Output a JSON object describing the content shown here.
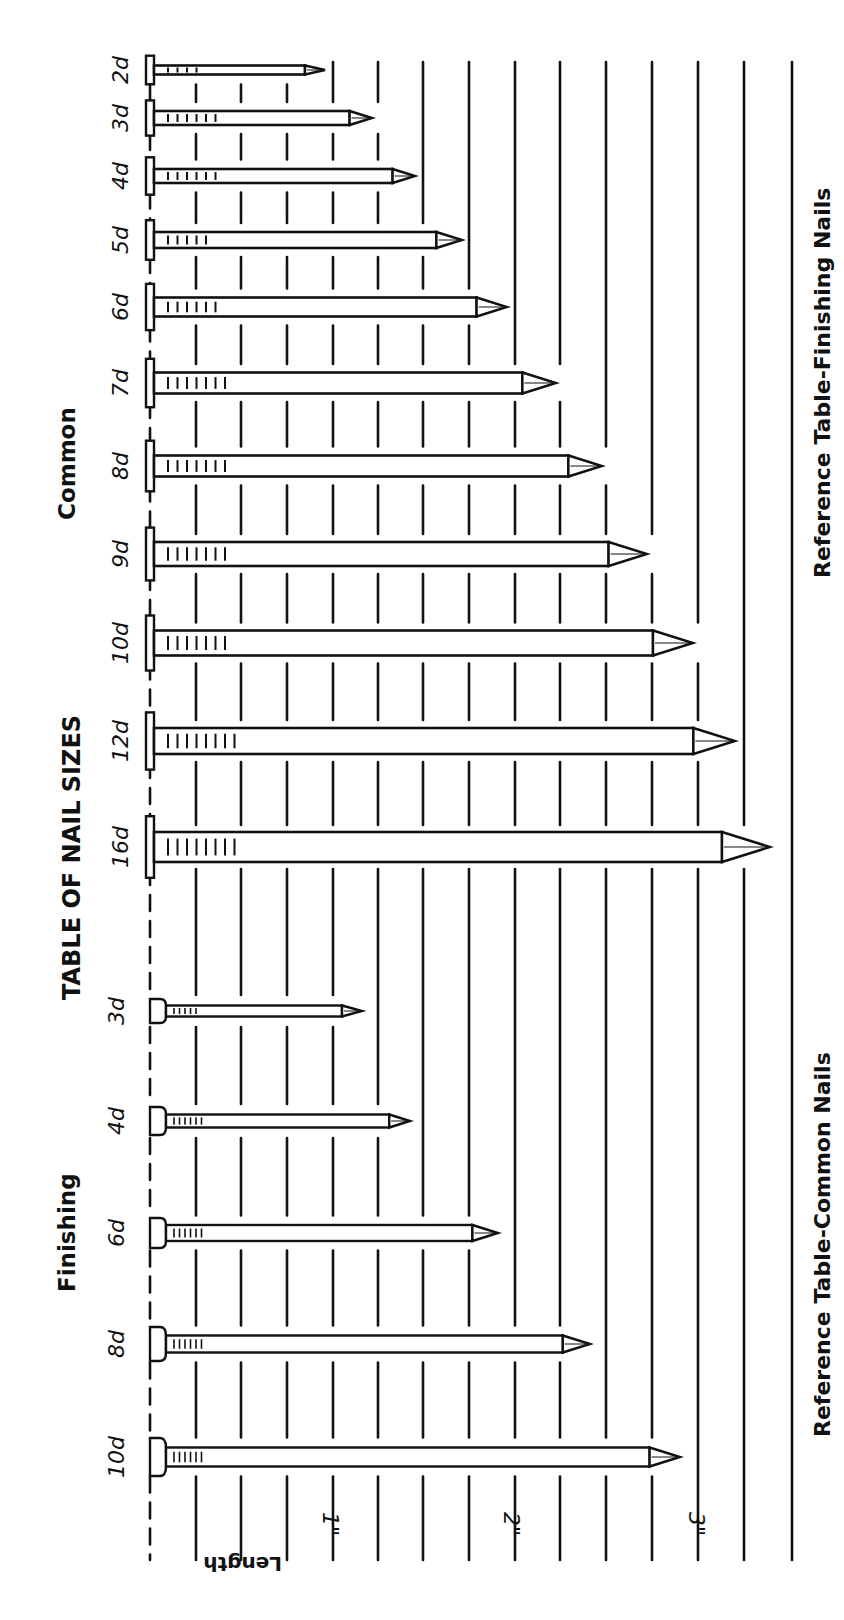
{
  "title": "TABLE OF NAIL SIZES",
  "groups": {
    "common": "Common",
    "finishing": "Finishing"
  },
  "reference_labels": {
    "finishing": "Reference Table-Finishing Nails",
    "common": "Reference Table-Common Nails"
  },
  "axis": {
    "label": "Length",
    "ticks": [
      {
        "label": "1\"",
        "x": 337
      },
      {
        "label": "2\"",
        "x": 518
      },
      {
        "label": "3\"",
        "x": 703
      }
    ],
    "gridlines_x": [
      150,
      196,
      241,
      287,
      333,
      378,
      423,
      469,
      515,
      560,
      606,
      652,
      698,
      744,
      792
    ],
    "grid_top": 62,
    "grid_bottom": 1560,
    "increment": "1/8 inch"
  },
  "colors": {
    "ink": "#111111",
    "paper": "#ffffff"
  },
  "chart_data": {
    "type": "bar",
    "title": "TABLE OF NAIL SIZES",
    "xlabel": "",
    "ylabel": "Length",
    "orientation": "rotated 90° (lengths run left-to-right on page)",
    "unit": "inches",
    "grid": true,
    "grid_spacing_in": 0.125,
    "series": [
      {
        "name": "Common",
        "categories": [
          "2d",
          "3d",
          "4d",
          "5d",
          "6d",
          "7d",
          "8d",
          "9d",
          "10d",
          "12d",
          "16d"
        ],
        "values": [
          1.0,
          1.25,
          1.5,
          1.75,
          2.0,
          2.25,
          2.5,
          2.75,
          3.0,
          3.25,
          3.5
        ]
      },
      {
        "name": "Finishing",
        "categories": [
          "3d",
          "4d",
          "6d",
          "8d",
          "10d"
        ],
        "values": [
          1.25,
          1.5,
          2.0,
          2.5,
          3.0
        ]
      }
    ],
    "axis_ticks": [
      "1\"",
      "2\"",
      "3\""
    ],
    "annotations": [
      "Reference Table-Finishing Nails",
      "Reference Table-Common Nails"
    ]
  },
  "nails": {
    "common": [
      {
        "size": "2d",
        "y": 70,
        "tip": 325,
        "shank": 9,
        "head": 13,
        "marks": 4
      },
      {
        "size": "3d",
        "y": 118,
        "tip": 372,
        "shank": 14,
        "head": 16,
        "marks": 6
      },
      {
        "size": "4d",
        "y": 176,
        "tip": 415,
        "shank": 14,
        "head": 17,
        "marks": 6
      },
      {
        "size": "5d",
        "y": 240,
        "tip": 462,
        "shank": 16,
        "head": 18,
        "marks": 5
      },
      {
        "size": "6d",
        "y": 307,
        "tip": 507,
        "shank": 19,
        "head": 21,
        "marks": 6
      },
      {
        "size": "7d",
        "y": 383,
        "tip": 556,
        "shank": 21,
        "head": 22,
        "marks": 7
      },
      {
        "size": "8d",
        "y": 466,
        "tip": 602,
        "shank": 21,
        "head": 23,
        "marks": 7
      },
      {
        "size": "9d",
        "y": 554,
        "tip": 647,
        "shank": 24,
        "head": 24,
        "marks": 7
      },
      {
        "size": "10d",
        "y": 643,
        "tip": 693,
        "shank": 25,
        "head": 25,
        "marks": 7
      },
      {
        "size": "12d",
        "y": 741,
        "tip": 735,
        "shank": 26,
        "head": 26,
        "marks": 8
      },
      {
        "size": "16d",
        "y": 847,
        "tip": 770,
        "shank": 30,
        "head": 28,
        "marks": 8
      }
    ],
    "finishing": [
      {
        "size": "3d",
        "y": 1011,
        "tip": 362,
        "shank": 11,
        "head": 12,
        "marks": 5
      },
      {
        "size": "4d",
        "y": 1121,
        "tip": 410,
        "shank": 13,
        "head": 14,
        "marks": 6
      },
      {
        "size": "6d",
        "y": 1233,
        "tip": 498,
        "shank": 16,
        "head": 15,
        "marks": 6
      },
      {
        "size": "8d",
        "y": 1344,
        "tip": 590,
        "shank": 17,
        "head": 17,
        "marks": 6
      },
      {
        "size": "10d",
        "y": 1457,
        "tip": 680,
        "shank": 19,
        "head": 19,
        "marks": 6
      }
    ]
  }
}
